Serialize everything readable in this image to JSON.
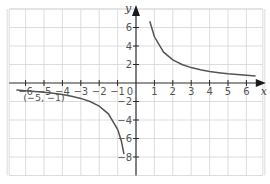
{
  "chart_data": {
    "type": "line",
    "title": "",
    "function": "y = 5/x",
    "xlabel": "x",
    "ylabel": "y",
    "xlim": [
      -7,
      7
    ],
    "ylim": [
      -10,
      8
    ],
    "grid": true,
    "x_ticks": [
      -6,
      -5,
      -4,
      -3,
      -2,
      -1,
      1,
      2,
      3,
      4,
      5,
      6
    ],
    "x_tick_labels": [
      "−6",
      "−5",
      "−4",
      "−3",
      "−2",
      "−1",
      "1",
      "2",
      "3",
      "4",
      "5",
      "6"
    ],
    "y_ticks": [
      6,
      4,
      2,
      -2,
      -4,
      -6,
      -8
    ],
    "y_tick_labels": [
      "6",
      "4",
      "2",
      "−2",
      "−4",
      "−6",
      "−8"
    ],
    "origin_label": "0",
    "series": [
      {
        "name": "positive branch",
        "x": [
          0.75,
          1,
          1.5,
          2,
          2.5,
          3,
          3.5,
          4,
          4.5,
          5,
          5.5,
          6,
          6.5
        ],
        "y": [
          6.67,
          5,
          3.33,
          2.5,
          2,
          1.67,
          1.43,
          1.25,
          1.11,
          1,
          0.91,
          0.83,
          0.77
        ]
      },
      {
        "name": "negative branch",
        "x": [
          -6.5,
          -6,
          -5.5,
          -5,
          -4.5,
          -4,
          -3.5,
          -3,
          -2.5,
          -2,
          -1.5,
          -1,
          -0.8,
          -0.65
        ],
        "y": [
          -0.77,
          -0.83,
          -0.91,
          -1,
          -1.11,
          -1.25,
          -1.43,
          -1.67,
          -2,
          -2.5,
          -3.33,
          -5,
          -6.25,
          -7.69
        ]
      }
    ],
    "annotations": [
      {
        "text": "(−5, −1)",
        "x": -5,
        "y": -1
      }
    ]
  }
}
